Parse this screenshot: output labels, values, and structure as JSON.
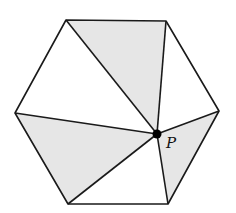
{
  "figure": {
    "width": 236,
    "height": 213,
    "background": "#ffffff",
    "stroke_color": "#1a1a1a",
    "shade_color": "#e6e6e6",
    "stroke_width": 1.6
  },
  "hexagon": {
    "vertices": {
      "top_left": [
        66,
        20
      ],
      "top_right": [
        166,
        21
      ],
      "right": [
        219,
        111
      ],
      "bottom_right": [
        168,
        204
      ],
      "bottom_left": [
        68,
        204
      ],
      "left": [
        15,
        113
      ]
    }
  },
  "point": {
    "name": "P",
    "label": "P",
    "position": [
      157,
      134
    ],
    "radius": 4.5,
    "label_position": [
      166,
      148
    ]
  },
  "triangles": [
    {
      "id": "t1",
      "vertices": [
        "top_left",
        "top_right",
        "P"
      ],
      "shaded": true
    },
    {
      "id": "t2",
      "vertices": [
        "top_right",
        "right",
        "P"
      ],
      "shaded": false
    },
    {
      "id": "t3",
      "vertices": [
        "right",
        "bottom_right",
        "P"
      ],
      "shaded": true
    },
    {
      "id": "t4",
      "vertices": [
        "bottom_right",
        "bottom_left",
        "P"
      ],
      "shaded": false
    },
    {
      "id": "t5",
      "vertices": [
        "bottom_left",
        "left",
        "P"
      ],
      "shaded": true
    },
    {
      "id": "t6",
      "vertices": [
        "left",
        "top_left",
        "P"
      ],
      "shaded": false
    }
  ]
}
